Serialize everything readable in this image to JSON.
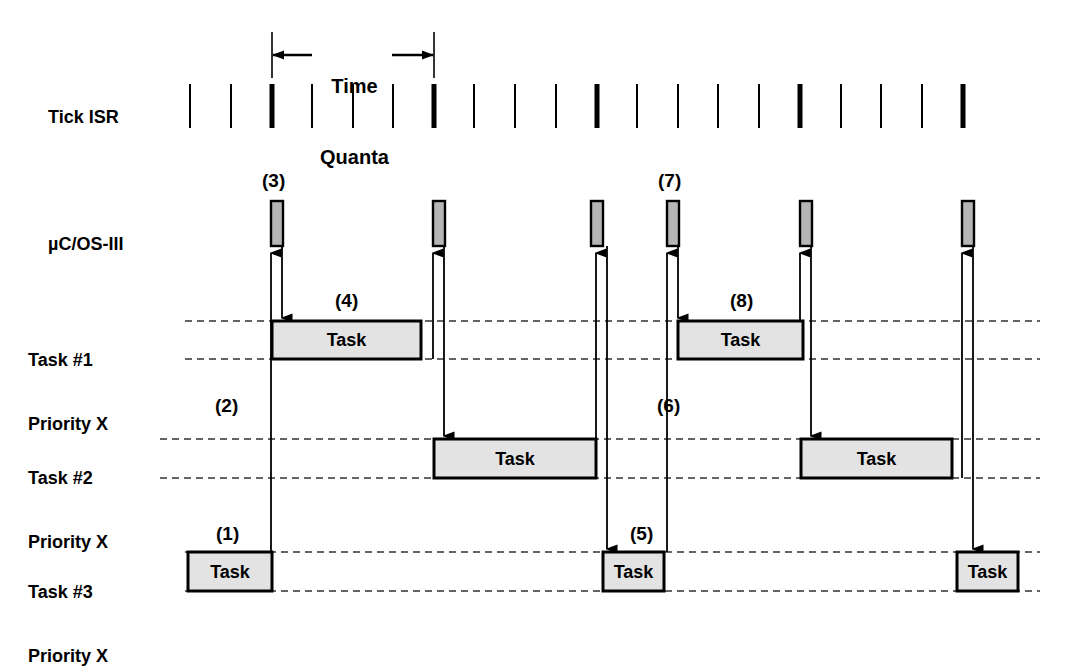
{
  "diagram": {
    "colors": {
      "stroke": "#000000",
      "task_fill": "#e3e3e3",
      "os_fill": "#b5b5b5",
      "dashed": "#333333"
    },
    "time_quanta": {
      "label_line1": "Time",
      "label_line2": "Quanta",
      "start_x": 272,
      "end_x": 434,
      "bar_y": 55,
      "guide_top": 32,
      "guide_bottom": 78
    },
    "rows": [
      {
        "name": "tick-isr",
        "label_line1": "Tick ISR",
        "label_line2": "",
        "label_x": 28,
        "label_y": 96
      },
      {
        "name": "os",
        "label_line1": "µC/OS-III",
        "label_line2": "",
        "label_x": 28,
        "label_y": 223
      },
      {
        "name": "task1",
        "label_line1": "Task #1",
        "label_line2": "Priority X",
        "label_x": 28,
        "label_y": 317
      },
      {
        "name": "task2",
        "label_line1": "Task #2",
        "label_line2": "Priority X",
        "label_x": 28,
        "label_y": 435
      },
      {
        "name": "task3",
        "label_line1": "Task #3",
        "label_line2": "Priority X",
        "label_x": 28,
        "label_y": 549
      }
    ],
    "tick_isr": {
      "y_top": 84,
      "y_bottom": 128,
      "normal_width": 2,
      "bold_width": 5,
      "ticks": [
        {
          "x": 190,
          "bold": false
        },
        {
          "x": 231,
          "bold": false
        },
        {
          "x": 272,
          "bold": true
        },
        {
          "x": 312,
          "bold": false
        },
        {
          "x": 353,
          "bold": false
        },
        {
          "x": 393,
          "bold": false
        },
        {
          "x": 434,
          "bold": true
        },
        {
          "x": 474,
          "bold": false
        },
        {
          "x": 515,
          "bold": false
        },
        {
          "x": 556,
          "bold": false
        },
        {
          "x": 597,
          "bold": true
        },
        {
          "x": 637,
          "bold": false
        },
        {
          "x": 678,
          "bold": false
        },
        {
          "x": 718,
          "bold": false
        },
        {
          "x": 759,
          "bold": false
        },
        {
          "x": 800,
          "bold": true
        },
        {
          "x": 841,
          "bold": false
        },
        {
          "x": 881,
          "bold": false
        },
        {
          "x": 922,
          "bold": false
        },
        {
          "x": 963,
          "bold": true
        }
      ]
    },
    "os_blocks": {
      "y_top": 201,
      "y_bottom": 246,
      "width": 12,
      "x_positions": [
        271,
        433,
        591,
        667,
        800,
        962
      ]
    },
    "task_rows": [
      {
        "name": "task1",
        "top": 321,
        "bottom": 359,
        "dash_start": 185,
        "dash_end": 1040,
        "boxes": [
          {
            "label": "Task",
            "x1": 272,
            "x2": 421
          },
          {
            "label": "Task",
            "x1": 678,
            "x2": 803
          }
        ]
      },
      {
        "name": "task2",
        "top": 439,
        "bottom": 478,
        "dash_start": 160,
        "dash_end": 1040,
        "boxes": [
          {
            "label": "Task",
            "x1": 434,
            "x2": 596
          },
          {
            "label": "Task",
            "x1": 801,
            "x2": 952
          }
        ]
      },
      {
        "name": "task3",
        "top": 552,
        "bottom": 591,
        "dash_start": 185,
        "dash_end": 1040,
        "boxes": [
          {
            "label": "Task",
            "x1": 188,
            "x2": 272
          },
          {
            "label": "Task",
            "x1": 603,
            "x2": 664
          },
          {
            "label": "Task",
            "x1": 957,
            "x2": 1018
          }
        ]
      }
    ],
    "arrows": [
      {
        "name": "up-arrow-task3-to-os-1",
        "x": 271,
        "y_from": 552,
        "y_to": 253,
        "dir": "up"
      },
      {
        "name": "down-arrow-os-to-task1-1",
        "x": 282,
        "y_from": 246,
        "y_to": 318,
        "dir": "down"
      },
      {
        "name": "up-arrow-task1-to-os-2",
        "x": 433,
        "y_from": 359,
        "y_to": 253,
        "dir": "up"
      },
      {
        "name": "down-arrow-os-to-task2-1",
        "x": 444,
        "y_from": 246,
        "y_to": 436,
        "dir": "down"
      },
      {
        "name": "up-arrow-task2-to-os-3",
        "x": 596,
        "y_from": 478,
        "y_to": 253,
        "dir": "up"
      },
      {
        "name": "down-arrow-os-to-task3-1",
        "x": 607,
        "y_from": 246,
        "y_to": 549,
        "dir": "down"
      },
      {
        "name": "up-arrow-task3-to-os-2",
        "x": 667,
        "y_from": 552,
        "y_to": 253,
        "dir": "up"
      },
      {
        "name": "down-arrow-os-to-task1-2",
        "x": 678,
        "y_from": 246,
        "y_to": 318,
        "dir": "down"
      },
      {
        "name": "up-arrow-task1-to-os-4",
        "x": 800,
        "y_from": 359,
        "y_to": 253,
        "dir": "up"
      },
      {
        "name": "down-arrow-os-to-task2-2",
        "x": 811,
        "y_from": 246,
        "y_to": 436,
        "dir": "down"
      },
      {
        "name": "up-arrow-task2-to-os-5",
        "x": 962,
        "y_from": 478,
        "y_to": 253,
        "dir": "up"
      },
      {
        "name": "down-arrow-os-to-task3-2",
        "x": 973,
        "y_from": 246,
        "y_to": 549,
        "dir": "down"
      }
    ],
    "step_markers": [
      {
        "id": "1",
        "label": "(1)",
        "x": 216,
        "y": 523
      },
      {
        "id": "2",
        "label": "(2)",
        "x": 215,
        "y": 395
      },
      {
        "id": "3",
        "label": "(3)",
        "x": 262,
        "y": 170
      },
      {
        "id": "4",
        "label": "(4)",
        "x": 335,
        "y": 290
      },
      {
        "id": "5",
        "label": "(5)",
        "x": 630,
        "y": 523
      },
      {
        "id": "6",
        "label": "(6)",
        "x": 657,
        "y": 395
      },
      {
        "id": "7",
        "label": "(7)",
        "x": 658,
        "y": 170
      },
      {
        "id": "8",
        "label": "(8)",
        "x": 730,
        "y": 290
      }
    ]
  }
}
